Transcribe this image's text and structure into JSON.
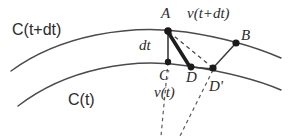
{
  "figure": {
    "type": "geometry-diagram",
    "width": 289,
    "height": 138,
    "background_color": "#ffffff",
    "ink_color": "#3a3a3a",
    "label_color": "#2b2b2b",
    "curves": [
      {
        "id": "curve-upper",
        "label": "C(t+dt)",
        "label_style": "sans-serif",
        "description": "upper arc through A and B"
      },
      {
        "id": "curve-lower",
        "label": "C(t)",
        "label_style": "sans-serif",
        "description": "lower arc through C, D and D-prime"
      }
    ],
    "points": [
      {
        "id": "A",
        "label": "A",
        "x": 168,
        "y": 31,
        "label_x": 161,
        "label_y": 6,
        "marker": "filled-dot"
      },
      {
        "id": "B",
        "label": "B",
        "x": 236,
        "y": 43,
        "label_x": 241,
        "label_y": 28,
        "marker": "filled-dot"
      },
      {
        "id": "C",
        "label": "C",
        "x": 168,
        "y": 62,
        "label_x": 159,
        "label_y": 68,
        "marker": "filled-dot"
      },
      {
        "id": "D",
        "label": "D",
        "x": 191,
        "y": 67,
        "label_x": 186,
        "label_y": 70,
        "marker": "filled-dot"
      },
      {
        "id": "Dp",
        "label": "D'",
        "x": 213,
        "y": 68,
        "label_x": 209,
        "label_y": 79,
        "marker": "filled-dot"
      }
    ],
    "segments": [
      {
        "id": "A-C",
        "from": "A",
        "to": "C",
        "style": "solid",
        "weight": "thin",
        "name": "segment-A-C"
      },
      {
        "id": "A-D",
        "from": "A",
        "to": "D",
        "style": "solid",
        "weight": "thick",
        "name": "segment-A-D"
      },
      {
        "id": "A-Dp",
        "from": "A",
        "to": "Dp",
        "style": "dashed",
        "weight": "thin",
        "name": "segment-A-Dprime"
      },
      {
        "id": "D-Dp",
        "from": "D",
        "to": "Dp",
        "style": "solid",
        "weight": "thin",
        "name": "segment-D-Dprime"
      },
      {
        "id": "Dp-B",
        "from": "Dp",
        "to": "B",
        "style": "solid",
        "weight": "thin",
        "name": "segment-Dprime-B"
      },
      {
        "id": "C-down",
        "from": "C",
        "to": "center-below",
        "style": "dashed",
        "weight": "thin",
        "name": "radius-line-from-C"
      },
      {
        "id": "Dp-down",
        "from": "Dp",
        "to": "center-below",
        "style": "dashed",
        "weight": "thin",
        "name": "radius-line-from-Dprime"
      }
    ],
    "annotations": [
      {
        "id": "dt",
        "text": "dt",
        "x": 139,
        "y": 38,
        "style": "serif-italic",
        "meaning": "normal-offset-between-curves"
      },
      {
        "id": "vtdt",
        "text": "v(t+dt)",
        "x": 187,
        "y": 6,
        "style": "serif-italic",
        "meaning": "velocity-at-t-plus-dt"
      },
      {
        "id": "vt",
        "text": "v(t)",
        "x": 154,
        "y": 85,
        "style": "serif-italic",
        "meaning": "velocity-at-t"
      }
    ]
  }
}
